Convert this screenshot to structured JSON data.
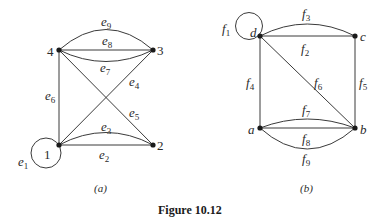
{
  "figure": {
    "title": "Figure 10.12",
    "panels": [
      {
        "caption": "(a)",
        "vertices": [
          {
            "id": "1",
            "label": "1",
            "x": 59,
            "y": 145
          },
          {
            "id": "2",
            "label": "2",
            "x": 153,
            "y": 145
          },
          {
            "id": "3",
            "label": "3",
            "x": 153,
            "y": 50
          },
          {
            "id": "4",
            "label": "4",
            "x": 59,
            "y": 50
          }
        ],
        "edges": [
          {
            "name": "e",
            "sub": "1",
            "from": "1",
            "to": "1",
            "type": "loop"
          },
          {
            "name": "e",
            "sub": "2",
            "from": "1",
            "to": "2",
            "type": "straight"
          },
          {
            "name": "e",
            "sub": "3",
            "from": "1",
            "to": "2",
            "type": "curve"
          },
          {
            "name": "e",
            "sub": "4",
            "from": "1",
            "to": "3",
            "type": "straight"
          },
          {
            "name": "e",
            "sub": "5",
            "from": "4",
            "to": "2",
            "type": "straight"
          },
          {
            "name": "e",
            "sub": "6",
            "from": "1",
            "to": "4",
            "type": "straight"
          },
          {
            "name": "e",
            "sub": "7",
            "from": "4",
            "to": "3",
            "type": "curve-down"
          },
          {
            "name": "e",
            "sub": "8",
            "from": "4",
            "to": "3",
            "type": "straight"
          },
          {
            "name": "e",
            "sub": "9",
            "from": "4",
            "to": "3",
            "type": "curve-up"
          }
        ]
      },
      {
        "caption": "(b)",
        "vertices": [
          {
            "id": "a",
            "label": "a",
            "x": 260,
            "y": 128
          },
          {
            "id": "b",
            "label": "b",
            "x": 355,
            "y": 128
          },
          {
            "id": "c",
            "label": "c",
            "x": 355,
            "y": 36
          },
          {
            "id": "d",
            "label": "d",
            "x": 260,
            "y": 36
          }
        ],
        "edges": [
          {
            "name": "f",
            "sub": "1",
            "from": "d",
            "to": "d",
            "type": "loop"
          },
          {
            "name": "f",
            "sub": "2",
            "from": "d",
            "to": "c",
            "type": "straight"
          },
          {
            "name": "f",
            "sub": "3",
            "from": "d",
            "to": "c",
            "type": "curve"
          },
          {
            "name": "f",
            "sub": "4",
            "from": "d",
            "to": "a",
            "type": "straight"
          },
          {
            "name": "f",
            "sub": "5",
            "from": "c",
            "to": "b",
            "type": "straight"
          },
          {
            "name": "f",
            "sub": "6",
            "from": "d",
            "to": "b",
            "type": "straight"
          },
          {
            "name": "f",
            "sub": "7",
            "from": "a",
            "to": "b",
            "type": "curve-up"
          },
          {
            "name": "f",
            "sub": "8",
            "from": "a",
            "to": "b",
            "type": "straight"
          },
          {
            "name": "f",
            "sub": "9",
            "from": "a",
            "to": "b",
            "type": "curve-down"
          }
        ]
      }
    ]
  },
  "labels": {
    "a": {
      "v1": "1",
      "v2": "2",
      "v3": "3",
      "v4": "4",
      "e": "e",
      "s1": "1",
      "s2": "2",
      "s3": "3",
      "s4": "4",
      "s5": "5",
      "s6": "6",
      "s7": "7",
      "s8": "8",
      "s9": "9",
      "caption": "(a)"
    },
    "b": {
      "va": "a",
      "vb": "b",
      "vc": "c",
      "vd": "d",
      "f": "f",
      "s1": "1",
      "s2": "2",
      "s3": "3",
      "s4": "4",
      "s5": "5",
      "s6": "6",
      "s7": "7",
      "s8": "8",
      "s9": "9",
      "caption": "(b)"
    },
    "figure_title": "Figure 10.12"
  }
}
